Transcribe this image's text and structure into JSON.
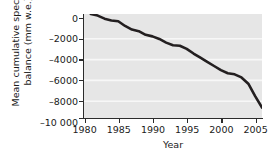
{
  "chart_data": {
    "type": "line",
    "title": "",
    "xlabel": "Year",
    "ylabel": "Mean cumulative specific net balance (mm w.e.)",
    "ylabel_line1": "Mean cumulative specific net",
    "ylabel_line2": "balance (mm w.e.)",
    "xlim": [
      1979,
      2005
    ],
    "ylim": [
      -10000,
      0
    ],
    "xticks": [
      1980,
      1985,
      1990,
      1995,
      2000,
      2005
    ],
    "xtick_labels": [
      "1980",
      "1985",
      "1990",
      "1995",
      "2000",
      "2005"
    ],
    "yticks": [
      0,
      -2000,
      -4000,
      -6000,
      -8000,
      -10000
    ],
    "ytick_labels": [
      "0",
      "–2000",
      "–4000",
      "–6000",
      "–8000",
      "–10 000"
    ],
    "grid": "horizontal",
    "grid_color": "#f5f5f5",
    "plot_background": "#e6e6e6",
    "line_color": "#231f20",
    "line_width": 2.6,
    "legend": "none",
    "x": [
      1980,
      1981,
      1982,
      1983,
      1984,
      1985,
      1986,
      1987,
      1988,
      1989,
      1990,
      1991,
      1992,
      1993,
      1994,
      1995,
      1996,
      1997,
      1998,
      1999,
      2000,
      2001,
      2002,
      2003,
      2004,
      2005
    ],
    "values": [
      0,
      -150,
      -450,
      -620,
      -700,
      -1150,
      -1500,
      -1650,
      -2000,
      -2150,
      -2400,
      -2750,
      -3000,
      -3050,
      -3350,
      -3800,
      -4200,
      -4600,
      -5000,
      -5400,
      -5700,
      -5800,
      -6100,
      -6700,
      -7900,
      -9000
    ],
    "series": [
      {
        "name": "Mean cumulative specific net balance",
        "values": [
          0,
          -150,
          -450,
          -620,
          -700,
          -1150,
          -1500,
          -1650,
          -2000,
          -2150,
          -2400,
          -2750,
          -3000,
          -3050,
          -3350,
          -3800,
          -4200,
          -4600,
          -5000,
          -5400,
          -5700,
          -5800,
          -6100,
          -6700,
          -7900,
          -9000
        ]
      }
    ]
  }
}
